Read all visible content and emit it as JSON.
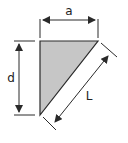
{
  "diagram": {
    "labels": {
      "width": "a",
      "height": "d",
      "hypotenuse": "L"
    },
    "colors": {
      "fill": "#c6c6c6",
      "stroke": "#2a2a2a",
      "background": "#ffffff"
    }
  }
}
